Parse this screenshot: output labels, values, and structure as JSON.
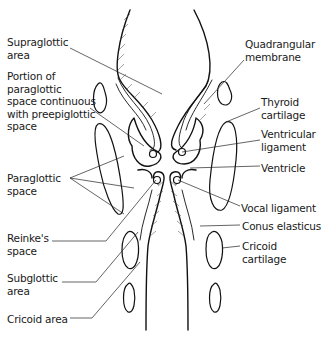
{
  "figure": {
    "left_labels": [
      {
        "id": "supraglottic-area",
        "text": "Supraglottic\narea",
        "x": 7,
        "y": 36
      },
      {
        "id": "paraglottic-preepiglottic",
        "text": "Portion of\nparaglottic\nspace continuous\nwith preepiglottic\nspace",
        "x": 7,
        "y": 70
      },
      {
        "id": "paraglottic-space",
        "text": "Paraglottic\nspace",
        "x": 7,
        "y": 172
      },
      {
        "id": "reinkes-space",
        "text": "Reinke's\nspace",
        "x": 7,
        "y": 232
      },
      {
        "id": "subglottic-area",
        "text": "Subglottic\narea",
        "x": 7,
        "y": 272
      },
      {
        "id": "cricoid-area",
        "text": "Cricoid area",
        "x": 7,
        "y": 313
      }
    ],
    "right_labels": [
      {
        "id": "quadrangular-membrane",
        "text": "Quadrangular\nmembrane",
        "x": 245,
        "y": 38
      },
      {
        "id": "thyroid-cartilage",
        "text": "Thyroid\ncartilage",
        "x": 261,
        "y": 96
      },
      {
        "id": "ventricular-ligament",
        "text": "Ventricular\nligament",
        "x": 261,
        "y": 128
      },
      {
        "id": "ventricle",
        "text": "Ventricle",
        "x": 261,
        "y": 162
      },
      {
        "id": "vocal-ligament",
        "text": "Vocal ligament",
        "x": 241,
        "y": 202
      },
      {
        "id": "conus-elasticus",
        "text": "Conus elasticus",
        "x": 242,
        "y": 220
      },
      {
        "id": "cricoid-cartilage",
        "text": "Cricoid\ncartilage",
        "x": 242,
        "y": 240
      }
    ]
  },
  "colors": {
    "background": "#ffffff",
    "ink": "#111111",
    "label_text": "#1a1a1a"
  }
}
